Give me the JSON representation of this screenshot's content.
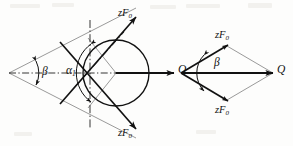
{
  "figure": {
    "domain_type": "diagram",
    "background_color": "#fdfdfc",
    "line_color": "#111111",
    "thin_line_color": "#6f6f6f",
    "left_diagram": {
      "name": "circle-tangent-force-diagram",
      "labels": {
        "force_upper": {
          "text": "zF",
          "sub": "0"
        },
        "force_lower": {
          "text": "zF",
          "sub": "0"
        },
        "resultant": "Q",
        "angle_beta": "β",
        "angle_alpha": {
          "text": "α",
          "sub": "1"
        }
      },
      "geometry": {
        "apex_x": 9,
        "apex_y": 73,
        "circle_cx": 116,
        "circle_cy": 73,
        "circle_r": 33,
        "q_arrow_end_x": 176,
        "half_angle_deg": 30
      }
    },
    "right_diagram": {
      "name": "rhombus-force-diagram",
      "labels": {
        "force_upper": {
          "text": "zF",
          "sub": "0"
        },
        "force_lower": {
          "text": "zF",
          "sub": "0"
        },
        "resultant": "Q",
        "angle_beta": "β"
      },
      "geometry": {
        "left_vertex_x": 181,
        "left_vertex_y": 73,
        "right_vertex_x": 273,
        "right_vertex_y": 73,
        "top_vertex_x": 227,
        "top_vertex_y": 46,
        "bottom_vertex_x": 227,
        "bottom_vertex_y": 100
      }
    }
  }
}
